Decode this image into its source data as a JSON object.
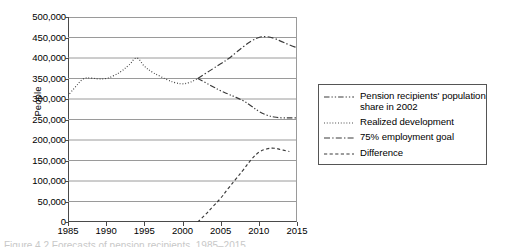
{
  "chart_data": {
    "type": "line",
    "title": "",
    "xlabel": "",
    "ylabel": "People",
    "xlim": [
      1985,
      2015
    ],
    "ylim": [
      0,
      500000
    ],
    "ytick_step": 50000,
    "xtick_step": 5,
    "grid": "horizontal",
    "legend_position": "right-outside",
    "ytick_labels": [
      "0",
      "50,000",
      "100,000",
      "150,000",
      "200,000",
      "250,000",
      "300,000",
      "350,000",
      "400,000",
      "450,000",
      "500,000"
    ],
    "ytick_values": [
      0,
      50000,
      100000,
      150000,
      200000,
      250000,
      300000,
      350000,
      400000,
      450000,
      500000
    ],
    "xtick_labels": [
      "1985",
      "1990",
      "1995",
      "2000",
      "2005",
      "2010",
      "2015"
    ],
    "xtick_values": [
      1985,
      1990,
      1995,
      2000,
      2005,
      2010,
      2015
    ],
    "series": [
      {
        "name": "Pension recipients' population share in 2002",
        "style": "dash-dot-dot",
        "color": "#3a3a3a",
        "x": [
          2002,
          2003,
          2004,
          2005,
          2006,
          2007,
          2008,
          2009,
          2010,
          2011,
          2012,
          2013,
          2014,
          2015
        ],
        "values": [
          350000,
          340000,
          330000,
          320000,
          312000,
          304000,
          295000,
          283000,
          270000,
          261000,
          256000,
          254000,
          254000,
          254000
        ]
      },
      {
        "name": "Realized development",
        "style": "dotted",
        "color": "#3a3a3a",
        "x": [
          1985,
          1986,
          1987,
          1988,
          1989,
          1990,
          1991,
          1992,
          1993,
          1994,
          1995,
          1996,
          1997,
          1998,
          1999,
          2000,
          2001,
          2002
        ],
        "values": [
          308000,
          330000,
          349000,
          351000,
          349000,
          350000,
          357000,
          368000,
          383000,
          400000,
          380000,
          366000,
          356000,
          347000,
          340000,
          337000,
          341000,
          350000
        ]
      },
      {
        "name": "75% employment goal",
        "style": "dash-dot",
        "color": "#3a3a3a",
        "x": [
          2002,
          2003,
          2004,
          2005,
          2006,
          2007,
          2008,
          2009,
          2010,
          2011,
          2012,
          2013,
          2014,
          2015
        ],
        "values": [
          350000,
          362000,
          374000,
          386000,
          398000,
          413000,
          428000,
          441000,
          450000,
          452000,
          448000,
          440000,
          432000,
          425000
        ]
      },
      {
        "name": "Difference",
        "style": "dashed",
        "color": "#3a3a3a",
        "x": [
          2002,
          2003,
          2004,
          2005,
          2006,
          2007,
          2008,
          2009,
          2010,
          2011,
          2012,
          2013,
          2014
        ],
        "values": [
          0,
          18000,
          38000,
          58000,
          82000,
          105000,
          128000,
          152000,
          170000,
          178000,
          180000,
          176000,
          172000
        ]
      }
    ]
  },
  "legend": {
    "items": [
      {
        "label": "Pension recipients' population share in 2002",
        "style": "dash-dot-dot"
      },
      {
        "label": "Realized development",
        "style": "dotted"
      },
      {
        "label": "75% employment goal",
        "style": "dash-dot"
      },
      {
        "label": "Difference",
        "style": "dashed"
      }
    ]
  },
  "caption": {
    "text": "Figure 4.2   Forecasts of pension recipients, 1985–2015"
  }
}
